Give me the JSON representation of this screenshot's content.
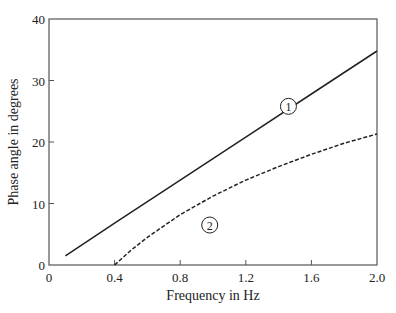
{
  "chart_data": {
    "type": "line",
    "title": "",
    "xlabel": "Frequency in Hz",
    "ylabel": "Phase angle in degrees",
    "xlim": [
      0,
      2.0
    ],
    "ylim": [
      0,
      40
    ],
    "x_ticks": [
      0,
      0.4,
      0.8,
      1.2,
      1.6,
      2.0
    ],
    "x_tick_labels": [
      "0",
      "0.4",
      "0.8",
      "1.2",
      "1.6",
      "2.0"
    ],
    "y_ticks": [
      0,
      10,
      20,
      30,
      40
    ],
    "y_tick_labels": [
      "0",
      "10",
      "20",
      "30",
      "40"
    ],
    "grid": false,
    "legend": "inline circled labels",
    "series": [
      {
        "name": "1",
        "label": "①",
        "style": "solid",
        "x": [
          0.1,
          0.4,
          0.8,
          1.2,
          1.6,
          2.0
        ],
        "y": [
          1.5,
          6.8,
          13.8,
          20.8,
          27.8,
          34.8
        ],
        "label_pos": [
          1.46,
          25.8
        ]
      },
      {
        "name": "2",
        "label": "②",
        "style": "dashed",
        "x": [
          0.4,
          0.5,
          0.6,
          0.8,
          1.0,
          1.2,
          1.4,
          1.6,
          1.8,
          2.0
        ],
        "y": [
          0,
          2.4,
          4.5,
          8.2,
          11.2,
          13.8,
          16.0,
          18.0,
          19.8,
          21.3
        ],
        "label_pos": [
          0.98,
          6.5
        ]
      }
    ]
  }
}
